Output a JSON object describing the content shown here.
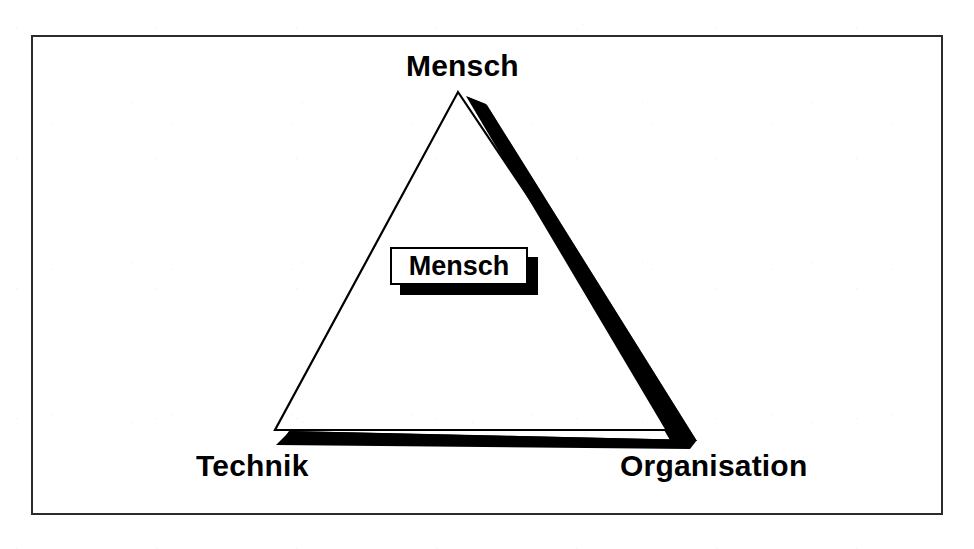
{
  "page": {
    "background_color": "#ffffff",
    "width": 974,
    "height": 549
  },
  "frame": {
    "border_color": "#2b2b2b",
    "fill_color": "#ffffff"
  },
  "diagram": {
    "type": "triangle-model",
    "name": "Mensch-Technik-Organisation",
    "outline_color": "#000000",
    "shadow_color": "#000000",
    "vertices": {
      "top": {
        "label": "Mensch",
        "x": 458,
        "y": 92
      },
      "bottom_left": {
        "label": "Technik",
        "x": 275,
        "y": 430
      },
      "bottom_right": {
        "label": "Organisation",
        "x": 685,
        "y": 430
      }
    }
  },
  "labels": {
    "top": "Mensch",
    "bottom_left": "Technik",
    "bottom_right": "Organisation"
  },
  "center_box": {
    "label": "Mensch",
    "fill_color": "#ffffff",
    "border_color": "#000000",
    "shadow_color": "#000000"
  }
}
